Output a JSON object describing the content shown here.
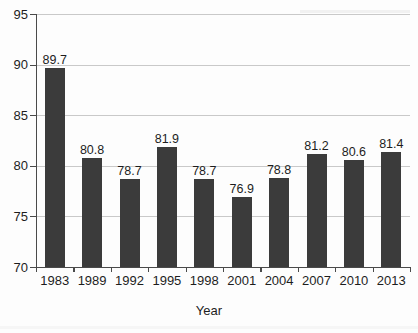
{
  "chart_data": {
    "type": "bar",
    "title": "",
    "xlabel": "Year",
    "ylabel": "",
    "categories": [
      "1983",
      "1989",
      "1992",
      "1995",
      "1998",
      "2001",
      "2004",
      "2007",
      "2010",
      "2013"
    ],
    "values": [
      89.7,
      80.8,
      78.7,
      81.9,
      78.7,
      76.9,
      78.8,
      81.2,
      80.6,
      81.4
    ],
    "value_labels": [
      "89.7",
      "80.8",
      "78.7",
      "81.9",
      "78.7",
      "76.9",
      "78.8",
      "81.2",
      "80.6",
      "81.4"
    ],
    "ylim": [
      70,
      95
    ],
    "yticks": [
      70,
      75,
      80,
      85,
      90,
      95
    ],
    "ytick_labels": [
      "70",
      "75",
      "80",
      "85",
      "90",
      "95"
    ],
    "grid": true,
    "legend": null,
    "bar_color": "#3b3b3b",
    "gridline_color": "#c9c9c9",
    "axis_color": "#4a4a4a",
    "background_color": "#fdfdfd"
  }
}
